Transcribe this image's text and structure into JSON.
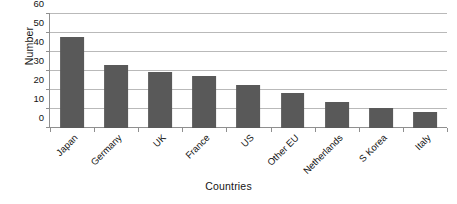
{
  "chart_data": {
    "type": "bar",
    "title": "",
    "xlabel": "Countries",
    "ylabel": "Number",
    "categories": [
      "Japan",
      "Germany",
      "UK",
      "France",
      "US",
      "Other EU",
      "Netherlands",
      "S Korea",
      "Italy"
    ],
    "values": [
      48,
      33,
      29.5,
      27.5,
      22.5,
      18.5,
      13.5,
      10.3,
      8.5
    ],
    "ylim": [
      0,
      60
    ],
    "ytick_values": [
      0,
      10,
      20,
      30,
      40,
      50,
      60
    ],
    "ytick_labels": [
      "0",
      "10",
      "20",
      "30",
      "40",
      "50",
      "60"
    ],
    "grid": true,
    "legend": "none",
    "bar_color": "#595959",
    "grid_color": "#b9b9b9",
    "axis_color": "#8f8f8f",
    "background_color": "#ffffff"
  }
}
